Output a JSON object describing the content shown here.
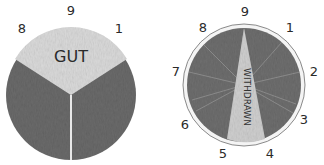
{
  "diagrams": [
    {
      "name": "gut-dial",
      "center_label": "GUT",
      "tick_labels": [
        "8",
        "9",
        "1"
      ],
      "colors": {
        "light": "#d9d9d9",
        "dark": "#6e6e6e"
      }
    },
    {
      "name": "withdrawn-dial",
      "center_label": "WITHDRAWN",
      "tick_labels": [
        "9",
        "1",
        "2",
        "3",
        "4",
        "5",
        "6",
        "7",
        "8"
      ],
      "colors": {
        "light": "#cfcfcf",
        "dark": "#707070",
        "rim": "#f2f2f2"
      }
    }
  ]
}
